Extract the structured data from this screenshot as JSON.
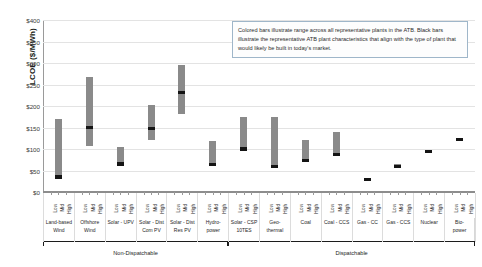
{
  "chart_data": {
    "type": "bar",
    "title": "",
    "xlabel": "",
    "ylabel": "LCOE ($/MWh)",
    "ylim": [
      0,
      400
    ],
    "ytick_labels": [
      "$400",
      "$350",
      "$300",
      "$250",
      "$200",
      "$150",
      "$100",
      "$50",
      "$0"
    ],
    "ytick_values": [
      400,
      350,
      300,
      250,
      200,
      150,
      100,
      50,
      0
    ],
    "grid": true,
    "legend_position": "none",
    "subtick_labels": [
      "Low",
      "Mid",
      "High"
    ],
    "bar_color": "#8a8a8a",
    "marker_color": "#141414",
    "categories": [
      "Land-based\nWind",
      "Offshore\nWind",
      "Solar - UPV",
      "Solar - Dist\nCom PV",
      "Solar - Dist\nRes PV",
      "Hydro-\npower",
      "Solar - CSP\n10TES",
      "Geo-\nthermal",
      "Coal",
      "Coal - CCS",
      "Gas - CC",
      "Gas - CCS",
      "Nuclear",
      "Bio-\npower"
    ],
    "series": [
      {
        "name": "Range across all representative plants in the ATB",
        "units": "$/MWh",
        "values": [
          {
            "category": "Land-based Wind",
            "low": 33,
            "high": 170,
            "representative": 35
          },
          {
            "category": "Offshore Wind",
            "low": 108,
            "high": 268,
            "representative": 150
          },
          {
            "category": "Solar - UPV",
            "low": 62,
            "high": 105,
            "representative": 65
          },
          {
            "category": "Solar - Dist Com PV",
            "low": 122,
            "high": 203,
            "representative": 148
          },
          {
            "category": "Solar - Dist Res PV",
            "low": 182,
            "high": 295,
            "representative": 232
          },
          {
            "category": "Hydropower",
            "low": 62,
            "high": 118,
            "representative": 64
          },
          {
            "category": "Solar - CSP 10TES",
            "low": 98,
            "high": 175,
            "representative": 100
          },
          {
            "category": "Geothermal",
            "low": 58,
            "high": 175,
            "representative": 60
          },
          {
            "category": "Coal",
            "low": 72,
            "high": 120,
            "representative": 74
          },
          {
            "category": "Coal - CCS",
            "low": 86,
            "high": 140,
            "representative": 88
          },
          {
            "category": "Gas - CC",
            "low": 28,
            "high": 33,
            "representative": 30
          },
          {
            "category": "Gas - CCS",
            "low": 56,
            "high": 66,
            "representative": 60
          },
          {
            "category": "Nuclear",
            "low": 92,
            "high": 96,
            "representative": 94
          },
          {
            "category": "Bio-power",
            "low": 120,
            "high": 124,
            "representative": 122
          }
        ]
      }
    ],
    "annotations": [
      {
        "name": "note-box",
        "text": "Colored bars illustrate range across all representative plants in the ATB. Black bars illustrate the representative ATB plant characteristics that align with the type of plant that would likely be built in today's market."
      }
    ],
    "groups": [
      {
        "label": "Non-Dispatchable",
        "start": 0,
        "end": 6
      },
      {
        "label": "Dispatchable",
        "start": 6,
        "end": 14
      }
    ]
  }
}
